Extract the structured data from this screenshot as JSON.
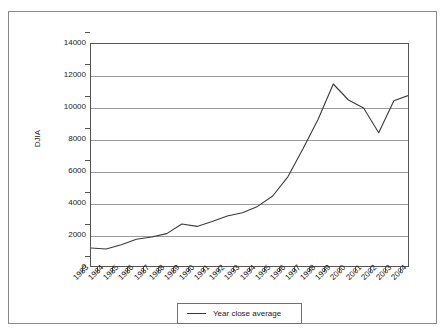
{
  "figure": {
    "top_cut_text": "",
    "background_color": "#ffffff",
    "frame_color": "#8a8a8a"
  },
  "chart_data": {
    "type": "line",
    "title": "",
    "xlabel": "",
    "ylabel": "DJIA",
    "ylim": [
      0,
      14000
    ],
    "ytick_step": 2000,
    "ytick_labels": [
      "14000",
      "12000",
      "10000",
      "8000",
      "6000",
      "4000",
      "2000",
      "0"
    ],
    "ytick_values": [
      14000,
      12000,
      10000,
      8000,
      6000,
      4000,
      2000,
      0
    ],
    "grid": true,
    "grid_axis": "y",
    "legend_position": "bottom-center",
    "series_color": "#3a3a3a",
    "categories": [
      "1983",
      "1984",
      "1985",
      "1986",
      "1987",
      "1988",
      "1989",
      "1990",
      "1991",
      "1992",
      "1993",
      "1994",
      "1995",
      "1996",
      "1997",
      "1998",
      "1999",
      "2000",
      "2001",
      "2002",
      "2003",
      "2004"
    ],
    "series": [
      {
        "name": "Year close average",
        "values": [
          1250,
          1190,
          1450,
          1800,
          1940,
          2150,
          2750,
          2600,
          2900,
          3250,
          3450,
          3850,
          4500,
          5700,
          7450,
          9300,
          11500,
          10500,
          10000,
          8450,
          10450,
          10800
        ]
      }
    ]
  },
  "legend": {
    "entries": [
      {
        "label": "Year close average",
        "marker": "line-swatch"
      }
    ]
  },
  "axes": {
    "y_title": "DJIA"
  }
}
